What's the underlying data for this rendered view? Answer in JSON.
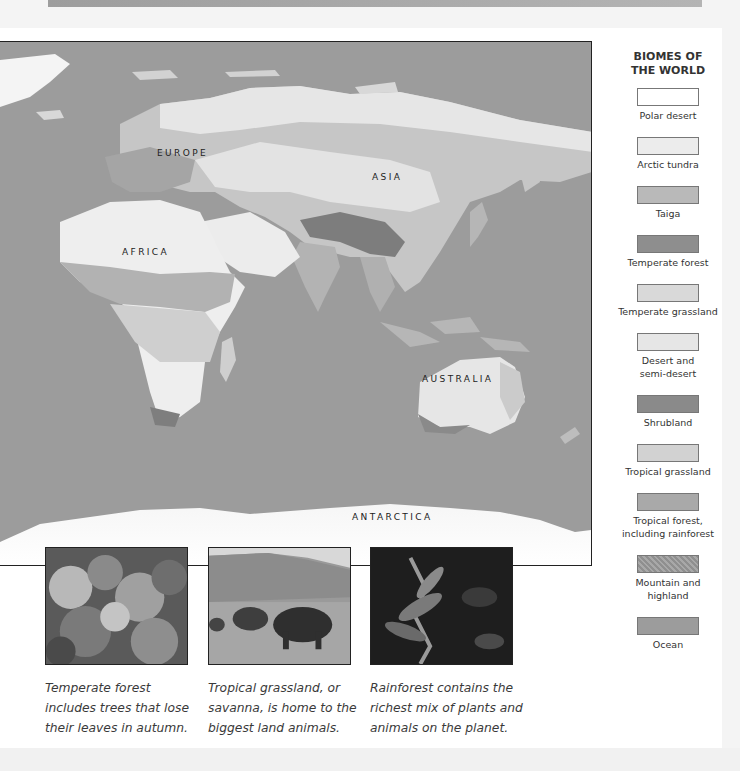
{
  "map": {
    "labels": {
      "europe": "EUROPE",
      "asia": "ASIA",
      "africa": "AFRICA",
      "australia": "AUSTRALIA",
      "antarctica": "ANTARCTICA"
    }
  },
  "legend": {
    "title_line1": "BIOMES OF",
    "title_line2": "THE WORLD",
    "items": [
      {
        "label": "Polar desert",
        "color": "#ffffff"
      },
      {
        "label": "Arctic tundra",
        "color": "#ececec"
      },
      {
        "label": "Taiga",
        "color": "#b9b9b9"
      },
      {
        "label": "Temperate forest",
        "color": "#8e8e8e"
      },
      {
        "label": "Temperate grassland",
        "color": "#d9d9d9"
      },
      {
        "label_line1": "Desert and",
        "label_line2": "semi-desert",
        "color": "#e6e6e6"
      },
      {
        "label": "Shrubland",
        "color": "#8a8a8a"
      },
      {
        "label": "Tropical grassland",
        "color": "#d2d2d2"
      },
      {
        "label_line1": "Tropical forest,",
        "label_line2": "including rainforest",
        "color": "#a9a9a9"
      },
      {
        "label_line1": "Mountain and",
        "label_line2": "highland",
        "color": "#9a9a9a"
      },
      {
        "label": "Ocean",
        "color": "#9c9c9c"
      }
    ]
  },
  "photos": [
    {
      "subject": "Temperate forest",
      "caption_lines": [
        "Temperate forest",
        "includes trees that lose",
        "their leaves in autumn."
      ]
    },
    {
      "subject": "Tropical grassland with elephants",
      "caption_lines": [
        "Tropical grassland, or",
        "savanna, is home to the",
        "biggest land animals."
      ]
    },
    {
      "subject": "Rainforest",
      "caption_lines": [
        "Rainforest contains the",
        "richest mix of plants and",
        "animals on the planet."
      ]
    }
  ]
}
